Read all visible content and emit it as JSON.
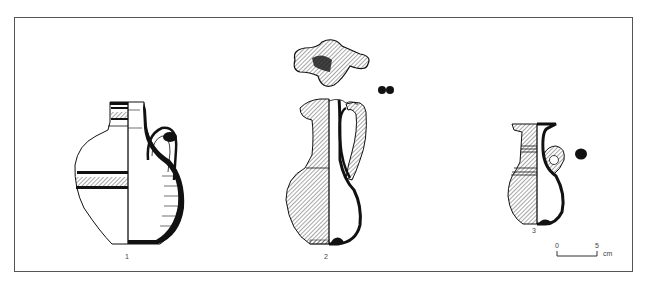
{
  "figure": {
    "type": "archaeological pottery drawing",
    "vessels": [
      {
        "number": "1",
        "description": "globular jug with ringed neck and single handle, painted bands"
      },
      {
        "number": "2",
        "description": "trefoil-mouth jug with tall handle, shown with top view of mouth"
      },
      {
        "number": "3",
        "description": "small flaring-rim jug with loop handle"
      }
    ],
    "vessel_labels": [
      "1",
      "2",
      "3"
    ],
    "scale_bar": {
      "start": "0",
      "end": "5",
      "unit": "cm"
    }
  },
  "colors": {
    "line": "#111111",
    "frame": "#555555",
    "background": "#ffffff"
  }
}
